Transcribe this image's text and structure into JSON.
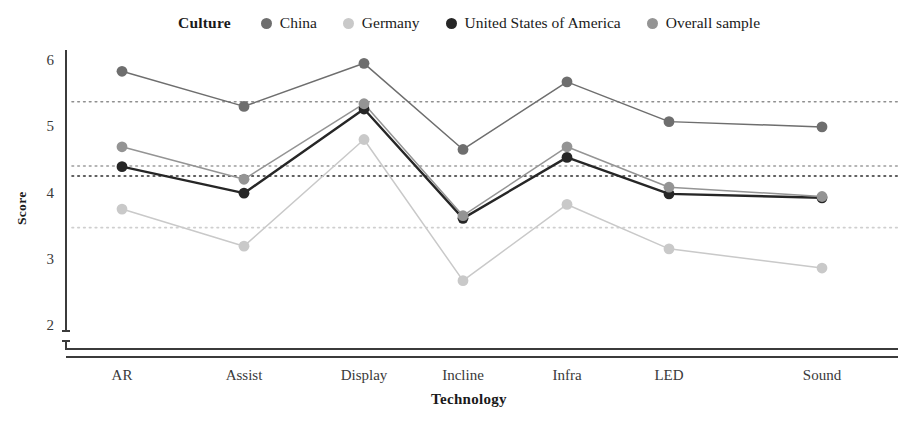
{
  "legend": {
    "title": "Culture",
    "items": [
      {
        "label": "China",
        "color": "#6e6e6e",
        "marker": "circle-marker"
      },
      {
        "label": "Germany",
        "color": "#c9c9c9",
        "marker": "circle-marker"
      },
      {
        "label": "United States of America",
        "color": "#262626",
        "marker": "circle-marker"
      },
      {
        "label": "Overall sample",
        "color": "#949494",
        "marker": "circle-marker"
      }
    ]
  },
  "chart_data": {
    "type": "line",
    "title": "",
    "xlabel": "Technology",
    "ylabel": "Score",
    "categories": [
      "AR",
      "Assist",
      "Display",
      "Incline",
      "Infra",
      "LED",
      "Sound"
    ],
    "ylim": [
      2,
      6
    ],
    "yticks": [
      2,
      3,
      4,
      5,
      6
    ],
    "grid": false,
    "legend_position": "top",
    "axis_break": true,
    "series": [
      {
        "name": "China",
        "color": "#6e6e6e",
        "values": [
          5.86,
          5.33,
          5.98,
          4.68,
          5.7,
          5.1,
          5.02
        ],
        "mean_line": 5.4
      },
      {
        "name": "Germany",
        "color": "#c9c9c9",
        "values": [
          3.78,
          3.22,
          4.83,
          2.7,
          3.85,
          3.18,
          2.89
        ],
        "mean_line": 3.5
      },
      {
        "name": "United States of America",
        "color": "#262626",
        "values": [
          4.42,
          4.02,
          5.29,
          3.64,
          4.56,
          4.01,
          3.95
        ],
        "mean_line": 4.28
      },
      {
        "name": "Overall sample",
        "color": "#949494",
        "values": [
          4.72,
          4.23,
          5.37,
          3.68,
          4.72,
          4.11,
          3.97
        ],
        "mean_line": 4.43
      }
    ],
    "reference_lines": [
      {
        "series": "China",
        "value": 5.4,
        "color": "#8f8f8f",
        "style": "dotted"
      },
      {
        "series": "Overall sample",
        "value": 4.43,
        "color": "#9c9c9c",
        "style": "dotted"
      },
      {
        "series": "United States of America",
        "value": 4.28,
        "color": "#2b2b2b",
        "style": "dotted"
      },
      {
        "series": "Germany",
        "value": 3.5,
        "color": "#cfcfcf",
        "style": "dotted"
      }
    ]
  }
}
